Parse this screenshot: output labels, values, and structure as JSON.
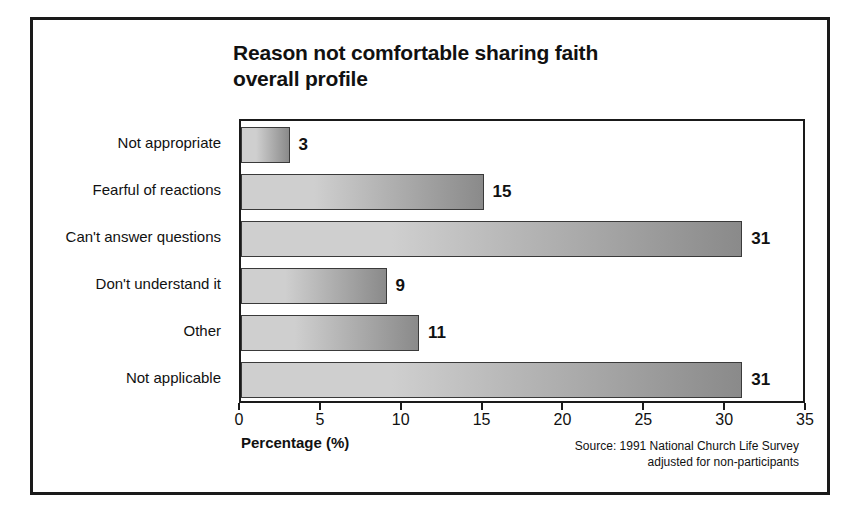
{
  "chart_data": {
    "type": "bar",
    "orientation": "horizontal",
    "title": "Reason not comfortable sharing faith overall profile",
    "title_line1": "Reason not comfortable sharing faith",
    "title_line2": "overall profile",
    "categories": [
      "Not appropriate",
      "Fearful of reactions",
      "Can't answer questions",
      "Don't understand it",
      "Other",
      "Not applicable"
    ],
    "values": [
      3,
      15,
      31,
      9,
      11,
      31
    ],
    "xlabel": "Percentage (%)",
    "ylabel": "",
    "xlim": [
      0,
      35
    ],
    "xticks": [
      0,
      5,
      10,
      15,
      20,
      25,
      30,
      35
    ],
    "grid": false,
    "legend": false,
    "bar_fill_light": "#cfcfcf",
    "bar_fill_dark": "#8a8a8a",
    "bar_border_color": "#3a3a3a",
    "axis_color": "#1a1a1a",
    "text_color": "#111111"
  },
  "source_note": {
    "line1": "Source: 1991 National Church Life Survey",
    "line2": "adjusted for non-participants"
  }
}
